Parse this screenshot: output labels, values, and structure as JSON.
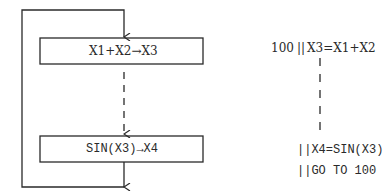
{
  "flowchart": {
    "box1": {
      "label": "X1+X2→X3"
    },
    "box2": {
      "label": "SIN(X3)→X4"
    }
  },
  "program": {
    "lines": [
      {
        "label": "100",
        "bars": "||",
        "code": "X3=X1+X2"
      },
      {
        "label": "",
        "bars": "||",
        "code": "X4=SIN(X3)"
      },
      {
        "label": "",
        "bars": "||",
        "code": "GO TO 100"
      }
    ]
  },
  "colors": {
    "ink": "#2a2a2a",
    "background": "#ffffff"
  }
}
